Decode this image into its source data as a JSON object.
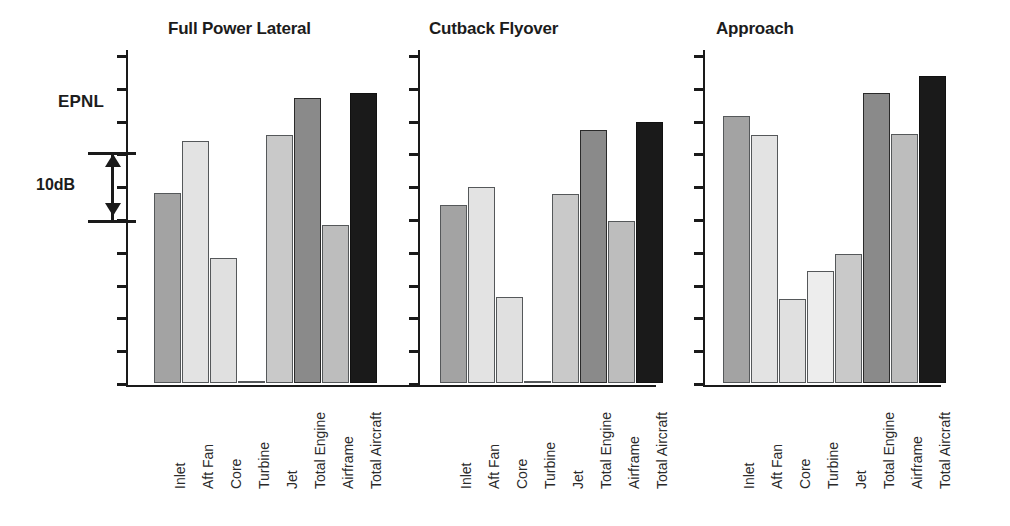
{
  "figure": {
    "axis_label": "EPNL",
    "scale_bar": {
      "label": "10dB",
      "db": 10
    }
  },
  "chart_data": {
    "type": "bar",
    "title": "",
    "ylabel": "EPNL",
    "xlabel": "",
    "grid": false,
    "legend": "none",
    "scale_note": "Relative EPNL; vertical scale bar spans 10 dB (two tick intervals, 5 dB per tick). Values below are dB relative to the lowest plotted bar (Full Power Lateral Turbine = 0).",
    "categories": [
      "Inlet",
      "Aft Fan",
      "Core",
      "Turbine",
      "Jet",
      "Total Engine",
      "Airframe",
      "Total Aircraft"
    ],
    "panels": [
      {
        "name": "Full Power Lateral",
        "values": [
          21.3,
          27.1,
          14.0,
          0.0,
          27.7,
          31.9,
          17.7,
          32.4
        ]
      },
      {
        "name": "Cutback Flyover",
        "values": [
          19.9,
          21.9,
          9.6,
          0.0,
          21.1,
          28.3,
          18.1,
          29.2
        ]
      },
      {
        "name": "Approach",
        "values": [
          29.9,
          27.7,
          9.4,
          12.5,
          14.4,
          32.4,
          27.9,
          34.4
        ]
      }
    ],
    "series": [
      {
        "name": "Full Power Lateral",
        "values": [
          21.3,
          27.1,
          14.0,
          0.0,
          27.7,
          31.9,
          17.7,
          32.4
        ]
      },
      {
        "name": "Cutback Flyover",
        "values": [
          19.9,
          21.9,
          9.6,
          0.0,
          21.1,
          28.3,
          18.1,
          29.2
        ]
      },
      {
        "name": "Approach",
        "values": [
          29.9,
          27.7,
          9.4,
          12.5,
          14.4,
          32.4,
          27.9,
          34.4
        ]
      }
    ],
    "bar_colors": [
      "#a3a3a3",
      "#e3e3e3",
      "#e0e0e0",
      "#ededed",
      "#c9c9c9",
      "#8a8a8a",
      "#bdbdbd",
      "#1a1a1a"
    ],
    "tick_count": 11,
    "ylim": [
      0,
      36.7
    ]
  },
  "panels_meta": [
    {
      "title": "Full Power Lateral"
    },
    {
      "title": "Cutback Flyover"
    },
    {
      "title": "Approach"
    }
  ]
}
